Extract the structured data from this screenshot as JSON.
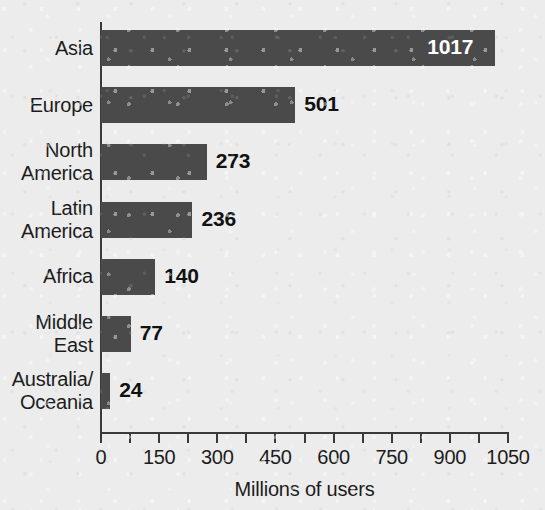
{
  "chart_data": {
    "type": "bar",
    "orientation": "horizontal",
    "title": "",
    "xlabel": "Millions of users",
    "ylabel": "",
    "categories": [
      "Asia",
      "Europe",
      "North America",
      "Latin America",
      "Africa",
      "Middle East",
      "Australia/ Oceania"
    ],
    "values": [
      1017,
      501,
      273,
      236,
      140,
      77,
      24
    ],
    "value_labels": [
      "1017",
      "501",
      "273",
      "236",
      "140",
      "77",
      "24"
    ],
    "xlim": [
      0,
      1050
    ],
    "xticks": [
      0,
      150,
      300,
      450,
      600,
      750,
      900,
      1050
    ],
    "xtick_labels": [
      "0",
      "150",
      "300",
      "450",
      "600",
      "750",
      "900",
      "1050"
    ],
    "minor_xticks": [
      75,
      225,
      375,
      525,
      675,
      825,
      975
    ],
    "grid": false,
    "legend": false,
    "bar_color": "#4a4a4a",
    "background_color": "#ececec",
    "axis_color": "#3a3a3a",
    "label_color": "#1c1c1c",
    "inside_label_color": "#ffffff"
  },
  "category_lines": [
    [
      "Asia"
    ],
    [
      "Europe"
    ],
    [
      "North",
      "America"
    ],
    [
      "Latin",
      "America"
    ],
    [
      "Africa"
    ],
    [
      "Middle",
      "East"
    ],
    [
      "Australia/",
      "Oceania"
    ]
  ]
}
